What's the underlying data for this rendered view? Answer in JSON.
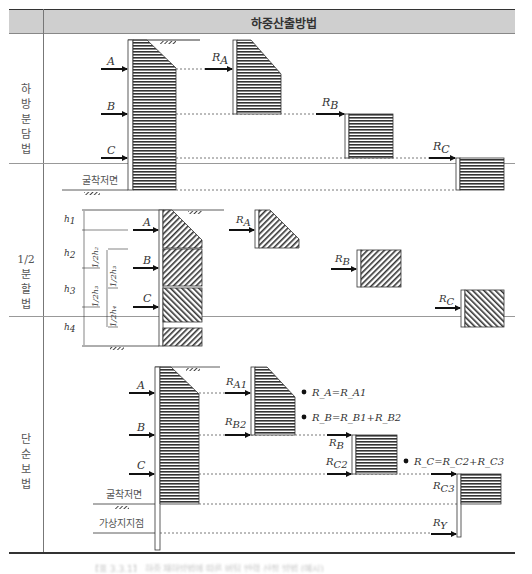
{
  "header": {
    "title": "하중산출방법"
  },
  "rows": [
    {
      "label": "하방분담법",
      "label_chars": [
        "하",
        "방",
        "분",
        "담",
        "법"
      ],
      "forces": [
        "A",
        "B",
        "C"
      ],
      "reactions": [
        {
          "base": "R",
          "sub": "A"
        },
        {
          "base": "R",
          "sub": "B"
        },
        {
          "base": "R",
          "sub": "C"
        }
      ],
      "ground_label": "굴착저면"
    },
    {
      "label": "1/2분할법",
      "label_chars": [
        "1/2",
        "분",
        "할",
        "법"
      ],
      "forces": [
        "A",
        "B",
        "C"
      ],
      "heights": [
        {
          "base": "h",
          "sub": "1"
        },
        {
          "base": "h",
          "sub": "2"
        },
        {
          "base": "h",
          "sub": "3"
        },
        {
          "base": "h",
          "sub": "4"
        }
      ],
      "half_heights": [
        "1/2h₂",
        "1/2h₃",
        "1/2h₃",
        "1/2h₄"
      ],
      "reactions": [
        {
          "base": "R",
          "sub": "A"
        },
        {
          "base": "R",
          "sub": "B"
        },
        {
          "base": "R",
          "sub": "C"
        }
      ]
    },
    {
      "label": "단순보법",
      "label_chars": [
        "단",
        "순",
        "보",
        "법"
      ],
      "forces": [
        "A",
        "B",
        "C"
      ],
      "reactions": [
        {
          "base": "R",
          "sub": "A1"
        },
        {
          "base": "R",
          "sub": "B2"
        },
        {
          "base": "R",
          "sub": "B"
        },
        {
          "base": "R",
          "sub": "C2"
        },
        {
          "base": "R",
          "sub": "C3"
        },
        {
          "base": "R",
          "sub": "Y"
        }
      ],
      "equations": [
        "R_A=R_A1",
        "R_B=R_B1+R_B2",
        "R_C=R_C2+R_C3"
      ],
      "ground_label": "굴착저면",
      "virtual_support_label": "가상지지점"
    }
  ],
  "caption": "【표 3.3.1】 하중 재하방법에 따른 버팀 반력 산정 방법 (예시)"
}
